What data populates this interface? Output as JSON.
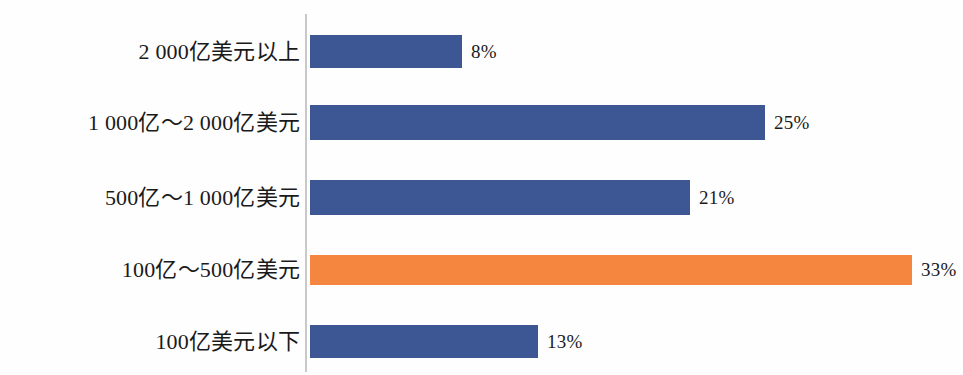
{
  "chart_data": {
    "type": "bar",
    "orientation": "horizontal",
    "title": "",
    "subtitle": "",
    "xlabel": "",
    "ylabel": "",
    "grid": false,
    "legend": "none",
    "xlim": [
      0,
      35
    ],
    "value_suffix": "%",
    "categories": [
      "2 000亿美元以上",
      "1 000亿～2 000亿美元",
      "500亿～1 000亿美元",
      "100亿～500亿美元",
      "100亿美元以下"
    ],
    "values": [
      8,
      25,
      21,
      33,
      13
    ],
    "value_labels": [
      "8%",
      "25%",
      "21%",
      "33%",
      "13%"
    ],
    "colors": [
      "#3d5694",
      "#3d5694",
      "#3d5694",
      "#f5863f",
      "#3d5694"
    ],
    "highlight_index": 3,
    "accent_color": "#f5863f",
    "series_color": "#3d5694",
    "axis_color": "#c9c9c9"
  },
  "bars": [
    {
      "label": "2 000亿美元以上",
      "value_label": "8%",
      "color": "#3d5694",
      "width_px": 152,
      "top_px": 35,
      "height_px": 33
    },
    {
      "label": "1 000亿～2 000亿美元",
      "value_label": "25%",
      "color": "#3d5694",
      "width_px": 455,
      "top_px": 105,
      "height_px": 35
    },
    {
      "label": "500亿～1 000亿美元",
      "value_label": "21%",
      "color": "#3d5694",
      "width_px": 380,
      "top_px": 180,
      "height_px": 35
    },
    {
      "label": "100亿～500亿美元",
      "value_label": "33%",
      "color": "#f5863f",
      "width_px": 602,
      "top_px": 255,
      "height_px": 30
    },
    {
      "label": "100亿美元以下",
      "value_label": "13%",
      "color": "#3d5694",
      "width_px": 228,
      "top_px": 325,
      "height_px": 33
    }
  ]
}
